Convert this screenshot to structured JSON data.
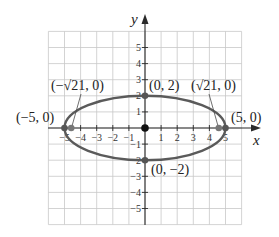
{
  "chart_data": {
    "type": "line",
    "title": "",
    "xlabel": "x",
    "ylabel": "y",
    "xlim": [
      -6,
      6
    ],
    "ylim": [
      -6,
      6
    ],
    "grid": true,
    "x_ticks": [
      -5,
      -4,
      -3,
      -2,
      -1,
      1,
      2,
      3,
      4,
      5
    ],
    "y_ticks": [
      -5,
      -4,
      -3,
      -2,
      -1,
      1,
      2,
      3,
      4,
      5
    ],
    "x_tick_labels": [
      "−5",
      "−4",
      "−3",
      "−2",
      "−1",
      "1",
      "2",
      "3",
      "4",
      "5"
    ],
    "y_tick_labels": [
      "−5",
      "−4",
      "−3",
      "−2",
      "−1",
      "1",
      "2",
      "3",
      "4",
      "5"
    ],
    "series": [
      {
        "name": "ellipse",
        "shape": "ellipse",
        "center": [
          0,
          0
        ],
        "semi_major_x": 5,
        "semi_minor_y": 2,
        "color": "#5a5a5a"
      }
    ],
    "points": [
      {
        "label": "(−5, 0)",
        "x": -5,
        "y": 0,
        "kind": "vertex"
      },
      {
        "label": "(−√21, 0)",
        "x": -4.583,
        "y": 0,
        "kind": "focus"
      },
      {
        "label": "(0, 2)",
        "x": 0,
        "y": 2,
        "kind": "co-vertex"
      },
      {
        "label": "(√21, 0)",
        "x": 4.583,
        "y": 0,
        "kind": "focus"
      },
      {
        "label": "(5, 0)",
        "x": 5,
        "y": 0,
        "kind": "vertex"
      },
      {
        "label": "(0, −2)",
        "x": 0,
        "y": -2,
        "kind": "co-vertex"
      },
      {
        "label": "",
        "x": 0,
        "y": 0,
        "kind": "center"
      }
    ]
  },
  "labels": {
    "x_axis": "x",
    "y_axis": "y",
    "neg5_0": "(−5, 0)",
    "neg_sqrt21_0": "(−√21, 0)",
    "zero_2": "(0, 2)",
    "sqrt21_0": "(√21, 0)",
    "five_0": "(5, 0)",
    "zero_neg2": "(0, −2)"
  },
  "ticks": {
    "x": [
      "−5",
      "−4",
      "−3",
      "−2",
      "−1",
      "1",
      "2",
      "3",
      "4",
      "5"
    ],
    "y_pos": [
      "1",
      "2",
      "3",
      "4",
      "5"
    ],
    "y_neg": [
      "−1",
      "−2",
      "−3",
      "−4",
      "−5"
    ]
  },
  "colors": {
    "grid": "#c8c8c8",
    "axis": "#2a2a2a",
    "ellipse": "#5a5a5a",
    "point": "#555555",
    "center_point": "#111111"
  }
}
